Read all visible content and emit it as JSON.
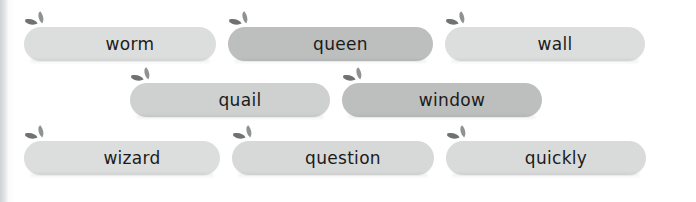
{
  "page": {
    "background_color": "#ffffff",
    "text_color": "#1b1b1b",
    "edge_color": "#cfd1d2"
  },
  "icons": {
    "sprout": "sprout-icon",
    "leaf_small_color": "#8f9192",
    "leaf_large_color": "#6f7173"
  },
  "rows": [
    {
      "index": 0,
      "words": [
        {
          "label": "worm",
          "fill": "#dcdedd",
          "width": 192,
          "icon": "sprout-icon"
        },
        {
          "label": "queen",
          "fill": "#bdbfbe",
          "width": 205,
          "icon": "sprout-icon"
        },
        {
          "label": "wall",
          "fill": "#dcdedd",
          "width": 200,
          "icon": "sprout-icon"
        }
      ]
    },
    {
      "index": 1,
      "words": [
        {
          "label": "quail",
          "fill": "#cfd1d0",
          "width": 200,
          "icon": "sprout-icon"
        },
        {
          "label": "window",
          "fill": "#bdbfbe",
          "width": 200,
          "icon": "sprout-icon"
        }
      ]
    },
    {
      "index": 2,
      "words": [
        {
          "label": "wizard",
          "fill": "#dcdedd",
          "width": 196,
          "icon": "sprout-icon"
        },
        {
          "label": "question",
          "fill": "#d7d9d8",
          "width": 202,
          "icon": "sprout-icon"
        },
        {
          "label": "quickly",
          "fill": "#d9dbda",
          "width": 200,
          "icon": "sprout-icon"
        }
      ]
    }
  ]
}
